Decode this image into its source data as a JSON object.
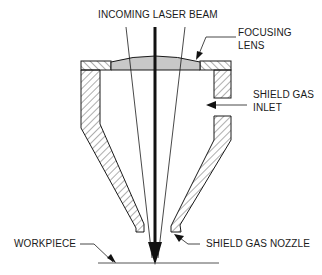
{
  "diagram": {
    "title": "INCOMING LASER BEAM",
    "labels": {
      "focusing_lens_line1": "FOCUSING",
      "focusing_lens_line2": "LENS",
      "shield_gas_inlet_line1": "SHIELD GAS",
      "shield_gas_inlet_line2": "INLET",
      "workpiece": "WORKPIECE",
      "shield_gas_nozzle": "SHIELD GAS NOZZLE"
    },
    "components": [
      "incoming-laser-beam",
      "focusing-lens",
      "nozzle-housing",
      "shield-gas-inlet",
      "shield-gas-nozzle",
      "workpiece"
    ],
    "colors": {
      "line": "#1a1a1a",
      "lens_fill": "#c8c8c8",
      "hatch": "#333333",
      "background": "#ffffff"
    }
  }
}
